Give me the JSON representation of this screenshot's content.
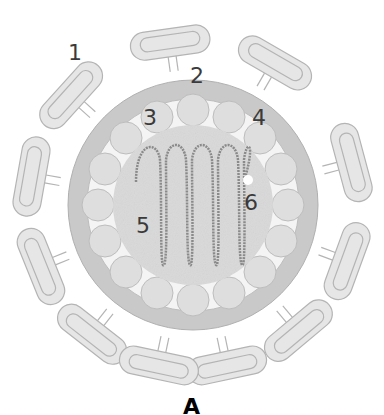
{
  "figure": {
    "caption": "A",
    "labels": [
      {
        "id": "1",
        "text": "1",
        "x": 68,
        "y": 42
      },
      {
        "id": "2",
        "text": "2",
        "x": 190,
        "y": 65
      },
      {
        "id": "3",
        "text": "3",
        "x": 143,
        "y": 107
      },
      {
        "id": "4",
        "text": "4",
        "x": 252,
        "y": 107
      },
      {
        "id": "5",
        "text": "5",
        "x": 136,
        "y": 215
      },
      {
        "id": "6",
        "text": "6",
        "x": 244,
        "y": 192
      }
    ]
  },
  "colors": {
    "spike": "#e6e6e6",
    "spike_outline": "#b4b4b4",
    "envelope": "#c9c9c9",
    "matrix": "#e8e8e8",
    "interior": "#d9d9d9",
    "helix": "#8a8a8a",
    "label": "#3a3a3a"
  }
}
